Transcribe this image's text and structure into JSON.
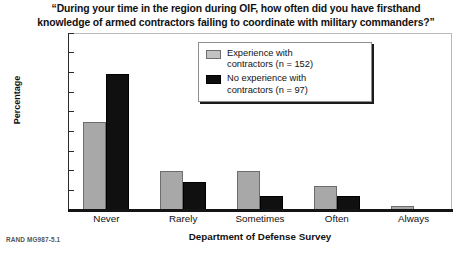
{
  "chart_data": {
    "type": "bar",
    "title": "“During your time in the region during OIF, how often did you have firsthand knowledge of armed contractors failing to coordinate with military commanders?”",
    "title_lines": [
      "“During your time in the region during OIF, how often did you have firsthand",
      "knowledge of armed contractors failing to coordinate with military commanders?”"
    ],
    "categories": [
      "Never",
      "Rarely",
      "Sometimes",
      "Often",
      "Always"
    ],
    "series": [
      {
        "name": "Experience with contractors (n = 152)",
        "name_lines": [
          "Experience with",
          "contractors (n = 152)"
        ],
        "color": "#a8a8a8",
        "values": [
          45,
          20,
          20,
          12,
          2
        ]
      },
      {
        "name": "No experience with contractors (n = 97)",
        "name_lines": [
          "No experience with",
          "contractors (n = 97)"
        ],
        "color": "#101010",
        "values": [
          69,
          14,
          7,
          7,
          0
        ]
      }
    ],
    "xlabel": "Department of Defense Survey",
    "ylabel": "Percentage",
    "ylim": [
      0,
      90
    ],
    "yticks": [
      0,
      10,
      20,
      30,
      40,
      50,
      60,
      70,
      80,
      90
    ],
    "grid": false,
    "legend_position": "top-center"
  },
  "footnote": "RAND MG987-5.1"
}
